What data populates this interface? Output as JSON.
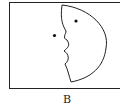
{
  "figure": {
    "label": "B",
    "colors": {
      "stroke": "#222222",
      "background": "#ffffff"
    }
  }
}
